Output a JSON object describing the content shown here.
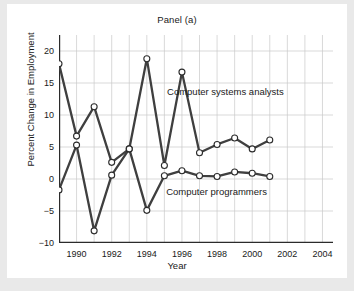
{
  "chart_data": {
    "type": "line",
    "title": "Panel (a)",
    "xlabel": "Year",
    "ylabel": "Percent Change in Employment",
    "xlim": [
      1989,
      2004.6
    ],
    "ylim": [
      -10,
      22.5
    ],
    "xticks": [
      "1990",
      "1992",
      "1994",
      "1996",
      "1998",
      "2000",
      "2002",
      "2004"
    ],
    "xtick_values": [
      1990,
      1992,
      1994,
      1996,
      1998,
      2000,
      2002,
      2004
    ],
    "yticks": [
      "20",
      "15",
      "10",
      "5",
      "0",
      "−5",
      "−10"
    ],
    "ytick_values": [
      20,
      15,
      10,
      5,
      0,
      -5,
      -10
    ],
    "grid": true,
    "legend_position": "inline-annotation",
    "x": [
      1989,
      1990,
      1991,
      1992,
      1993,
      1994,
      1995,
      1996,
      1997,
      1998,
      1999,
      2000,
      2001
    ],
    "series": [
      {
        "name": "Computer systems analysts",
        "values": [
          18.0,
          6.7,
          11.3,
          2.6,
          4.7,
          18.8,
          2.1,
          16.7,
          4.1,
          5.4,
          6.4,
          4.7,
          6.1
        ],
        "color": "#3f3f3f"
      },
      {
        "name": "Computer programmers",
        "values": [
          -1.7,
          5.3,
          -8.1,
          0.6,
          4.7,
          -4.9,
          0.5,
          1.3,
          0.5,
          0.4,
          1.1,
          0.9,
          0.4
        ],
        "color": "#3f3f3f"
      }
    ],
    "annotations": [
      {
        "text": "Computer systems analysts",
        "x": 1995.15,
        "y": 14.6
      },
      {
        "text": "Computer programmers",
        "x": 1995.1,
        "y": -1.1
      }
    ],
    "style": {
      "line_color": "#3f3f3f",
      "marker_face": "#ffffff",
      "marker_edge": "#2b2b2b",
      "grid_color": "#c9c9c9",
      "axis_color": "#2b2b2b",
      "plot_background": "#ffffff",
      "page_background": "#e9e9e9"
    }
  }
}
